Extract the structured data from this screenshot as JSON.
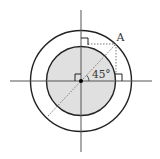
{
  "diagram": {
    "type": "geometry",
    "center": {
      "x": 81,
      "y": 81
    },
    "outer_circle": {
      "r": 50.5,
      "stroke": "#222222"
    },
    "inner_circle": {
      "r": 34.5,
      "fill": "#e0e0e0",
      "stroke": "#222222"
    },
    "axes_color": "#555555",
    "dotted_color": "#777777",
    "labels": {
      "point_a": "A",
      "angle": "45°"
    },
    "angle_degrees": 45
  }
}
